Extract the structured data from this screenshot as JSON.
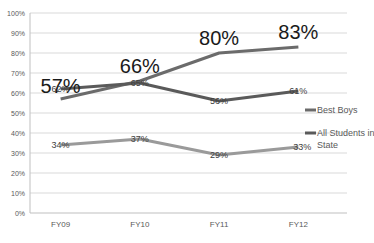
{
  "chart_data": {
    "type": "line",
    "title": "",
    "xlabel": "",
    "ylabel": "",
    "categories": [
      "FY09",
      "FY10",
      "FY11",
      "FY12"
    ],
    "ylim": [
      0,
      100
    ],
    "yticks": [
      "0%",
      "10%",
      "20%",
      "30%",
      "40%",
      "50%",
      "60%",
      "70%",
      "80%",
      "90%",
      "100%"
    ],
    "grid": true,
    "legend_position": "right",
    "series": [
      {
        "name": "Best Boys",
        "values": [
          57,
          66,
          80,
          83
        ],
        "color": "#6b6b6b",
        "labels": [
          "57%",
          "66%",
          "80%",
          "83%"
        ],
        "label_style": "large",
        "in_legend": true
      },
      {
        "name": "All Students in State",
        "values": [
          62,
          65,
          56,
          61
        ],
        "color": "#5a5a5a",
        "labels": [
          "62%",
          "65%",
          "56%",
          "61%"
        ],
        "label_style": "small",
        "in_legend": true
      },
      {
        "name": "",
        "values": [
          34,
          37,
          29,
          33
        ],
        "color": "#9a9a9a",
        "labels": [
          "34%",
          "37%",
          "29%",
          "33%"
        ],
        "label_style": "small",
        "in_legend": false
      }
    ]
  }
}
